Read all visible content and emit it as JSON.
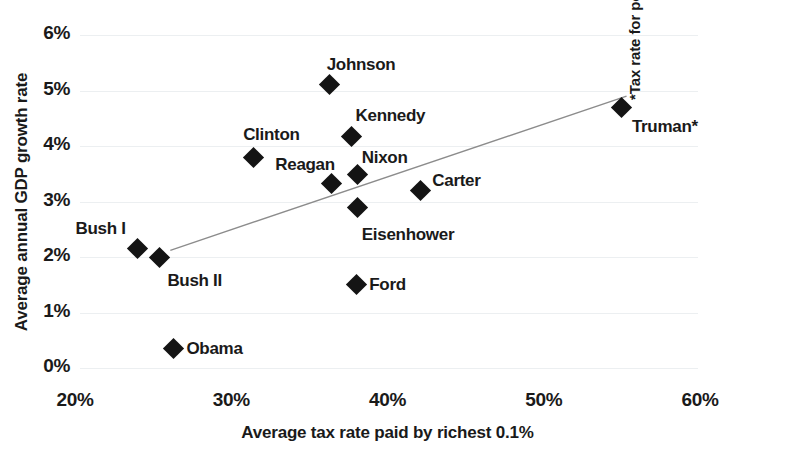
{
  "chart_data": {
    "type": "scatter",
    "title": "",
    "xlabel": "Average tax rate paid by richest 0.1%",
    "ylabel": "Average annual GDP growth rate",
    "annotation": "*Tax rate for post-war period only.",
    "xlim": [
      20,
      60
    ],
    "ylim": [
      0,
      6
    ],
    "xticks": [
      "20%",
      "30%",
      "40%",
      "50%",
      "60%"
    ],
    "xtick_values": [
      20,
      30,
      40,
      50,
      60
    ],
    "yticks": [
      "0%",
      "1%",
      "2%",
      "3%",
      "4%",
      "5%",
      "6%"
    ],
    "ytick_values": [
      0,
      1,
      2,
      3,
      4,
      5,
      6
    ],
    "grid": true,
    "legend": "none",
    "marker_color": "#141414",
    "trendline": {
      "show": true,
      "color": "#8c8c8c",
      "x_start": 26.1,
      "y_start": 2.12,
      "x_end": 55.3,
      "y_end": 4.9
    },
    "points": [
      {
        "label": "Bush I",
        "x": 24.0,
        "y": 2.15,
        "label_dx": -62,
        "label_dy": -30
      },
      {
        "label": "Bush II",
        "x": 25.4,
        "y": 2.0,
        "label_dx": 8,
        "label_dy": 14
      },
      {
        "label": "Obama",
        "x": 26.3,
        "y": 0.35,
        "label_dx": 13,
        "label_dy": -10
      },
      {
        "label": "Clinton",
        "x": 31.4,
        "y": 3.8,
        "label_dx": -10,
        "label_dy": -32
      },
      {
        "label": "Reagan",
        "x": 36.4,
        "y": 3.33,
        "label_dx": -56,
        "label_dy": -28
      },
      {
        "label": "Johnson",
        "x": 36.3,
        "y": 5.1,
        "label_dx": -3,
        "label_dy": -30
      },
      {
        "label": "Kennedy",
        "x": 37.7,
        "y": 4.17,
        "label_dx": 4,
        "label_dy": -31
      },
      {
        "label": "Nixon",
        "x": 38.1,
        "y": 3.48,
        "label_dx": 4,
        "label_dy": -27
      },
      {
        "label": "Eisenhower",
        "x": 38.1,
        "y": 2.9,
        "label_dx": 4,
        "label_dy": 18
      },
      {
        "label": "Ford",
        "x": 38.0,
        "y": 1.5,
        "label_dx": 13,
        "label_dy": -10
      },
      {
        "label": "Carter",
        "x": 42.1,
        "y": 3.2,
        "label_dx": 12,
        "label_dy": -19
      },
      {
        "label": "Truman*",
        "x": 55.0,
        "y": 4.7,
        "label_dx": 10,
        "label_dy": 10
      }
    ]
  }
}
